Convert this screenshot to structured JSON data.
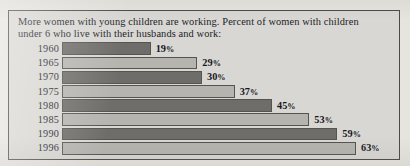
{
  "caption": {
    "line1": "More women with young children are working. Percent of women with children",
    "line2": "under 6 who live with their husbands and work:"
  },
  "colors": {
    "page_background": "#e6e4df",
    "chart_background": "#d8d7d3",
    "frame_border": "#4a4a48",
    "bar_dark": "#6e6d69",
    "bar_light": "#b5b4af",
    "bar_outline": "#55544f",
    "text": "#1c1c28"
  },
  "rows": [
    {
      "year": "1960",
      "value": 19,
      "label": "19",
      "pct": "%",
      "shade": "dark"
    },
    {
      "year": "1965",
      "value": 29,
      "label": "29",
      "pct": "%",
      "shade": "light"
    },
    {
      "year": "1970",
      "value": 30,
      "label": "30",
      "pct": "%",
      "shade": "dark"
    },
    {
      "year": "1975",
      "value": 37,
      "label": "37",
      "pct": "%",
      "shade": "light"
    },
    {
      "year": "1980",
      "value": 45,
      "label": "45",
      "pct": "%",
      "shade": "dark"
    },
    {
      "year": "1985",
      "value": 53,
      "label": "53",
      "pct": "%",
      "shade": "light"
    },
    {
      "year": "1990",
      "value": 59,
      "label": "59",
      "pct": "%",
      "shade": "dark"
    },
    {
      "year": "1996",
      "value": 63,
      "label": "63",
      "pct": "%",
      "shade": "light"
    }
  ],
  "chart_data": {
    "type": "bar",
    "orientation": "horizontal",
    "title": "More women with young children are working. Percent of women with children under 6 who live with their husbands and work:",
    "categories": [
      "1960",
      "1965",
      "1970",
      "1975",
      "1980",
      "1985",
      "1990",
      "1996"
    ],
    "values": [
      19,
      29,
      30,
      37,
      45,
      53,
      59,
      63
    ],
    "data_labels": [
      "19%",
      "29%",
      "30%",
      "37%",
      "45%",
      "53%",
      "59%",
      "63%"
    ],
    "xlabel": "",
    "ylabel": "",
    "xlim": [
      0,
      63
    ],
    "grid": false,
    "legend": null,
    "units": "percent"
  }
}
